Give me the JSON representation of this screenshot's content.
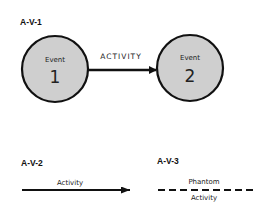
{
  "diagram": {
    "sections": [
      {
        "id": "A-V-1",
        "label": "A-V-1",
        "nodes": [
          {
            "title": "Event",
            "number": "1"
          },
          {
            "title": "Event",
            "number": "2"
          }
        ],
        "edge_label": "ACTIVITY"
      },
      {
        "id": "A-V-2",
        "label": "A-V-2",
        "edge_label": "Activity",
        "line_style": "solid"
      },
      {
        "id": "A-V-3",
        "label": "A-V-3",
        "edge_label_top": "Phantom",
        "edge_label_bottom": "Activity",
        "line_style": "dashed"
      }
    ],
    "colors": {
      "node_fill": "#cfcfcf",
      "stroke": "#111111",
      "background": "#ffffff"
    }
  }
}
